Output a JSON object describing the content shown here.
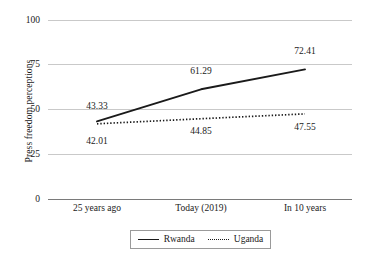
{
  "chart_data": {
    "type": "line",
    "title": "",
    "subtitle": "",
    "xlabel": "",
    "ylabel": "Press freedom perceptions",
    "categories": [
      "25 years ago",
      "Today (2019)",
      "In 10 years"
    ],
    "series": [
      {
        "name": "Rwanda",
        "style": "solid",
        "color": "#1a1a1a",
        "values": [
          43.33,
          61.29,
          72.41
        ],
        "labels": [
          "43.33",
          "61.29",
          "72.41"
        ],
        "label_position": "above"
      },
      {
        "name": "Uganda",
        "style": "dotted",
        "color": "#1a1a1a",
        "values": [
          42.01,
          44.85,
          47.55
        ],
        "labels": [
          "42.01",
          "44.85",
          "47.55"
        ],
        "label_position": "below"
      }
    ],
    "ylim": [
      0,
      100
    ],
    "yticks": [
      0,
      25,
      50,
      75,
      100
    ],
    "ytick_labels": [
      "0",
      "25",
      "50",
      "75",
      "100"
    ],
    "grid": true,
    "grid_color": "#c9c9c9",
    "axis_color": "#7a7a7a",
    "legend_position": "bottom",
    "legend_entries": [
      "Rwanda",
      "Uganda"
    ]
  },
  "axis": {
    "y_title": "Press freedom perceptions",
    "y_ticks": [
      {
        "label": "100",
        "value": 100
      },
      {
        "label": "75",
        "value": 75
      },
      {
        "label": "50",
        "value": 50
      },
      {
        "label": "25",
        "value": 25
      },
      {
        "label": "0",
        "value": 0
      }
    ],
    "x_ticks": [
      {
        "label": "25 years ago"
      },
      {
        "label": "Today (2019)"
      },
      {
        "label": "In 10 years"
      }
    ]
  },
  "legend": {
    "rwanda_label": "Rwanda",
    "uganda_label": "Uganda"
  },
  "labels": {
    "rwanda_0": "43.33",
    "rwanda_1": "61.29",
    "rwanda_2": "72.41",
    "uganda_0": "42.01",
    "uganda_1": "44.85",
    "uganda_2": "47.55"
  }
}
